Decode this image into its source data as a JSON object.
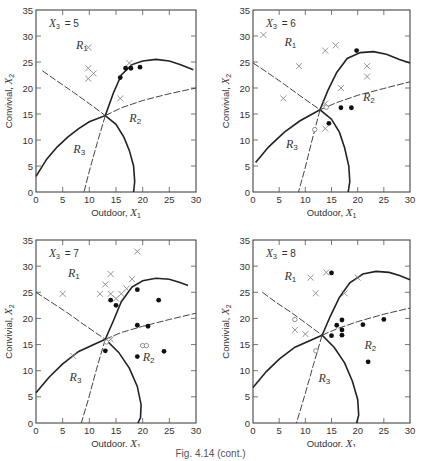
{
  "figure": {
    "caption": "Fig. 4.14 (cont.)"
  },
  "chart_data": [
    {
      "type": "scatter",
      "title": "X3 = 5",
      "panel_label": "X",
      "panel_sub": "3",
      "panel_value": "= 5",
      "xlabel": "Outdoor, X1",
      "ylabel": "Convivial, X2",
      "xlim": [
        0,
        30
      ],
      "ylim": [
        0,
        35
      ],
      "xticks": [
        0,
        5,
        10,
        15,
        20,
        25,
        30
      ],
      "yticks": [
        0,
        5,
        10,
        15,
        20,
        25,
        30,
        35
      ],
      "show_xlabel": true,
      "region_labels": [
        {
          "name": "R1",
          "x": 7.5,
          "y": 27.5
        },
        {
          "name": "R2",
          "x": 17.5,
          "y": 13.5
        },
        {
          "name": "R3",
          "x": 7,
          "y": 7.5
        }
      ],
      "series": [
        {
          "name": "Group 1 (x)",
          "marker": "cross",
          "points": [
            [
              9.8,
              27.8
            ],
            [
              9.8,
              23.8
            ],
            [
              9.8,
              21.8
            ],
            [
              10.8,
              22.8
            ],
            [
              17.5,
              24.8
            ],
            [
              15.8,
              18
            ]
          ]
        },
        {
          "name": "Group 2 (filled circle)",
          "marker": "dot",
          "points": [
            [
              15.8,
              22
            ],
            [
              16.8,
              23.8
            ],
            [
              17.8,
              23.8
            ],
            [
              19.5,
              24
            ]
          ]
        },
        {
          "name": "Group 3 (open circle)",
          "marker": "circle",
          "points": []
        }
      ],
      "boundaries": {
        "solid_upper": [
          [
            13,
            14.7
          ],
          [
            14.5,
            19
          ],
          [
            16,
            22.5
          ],
          [
            18,
            24.5
          ],
          [
            20,
            25.2
          ],
          [
            22.5,
            25.5
          ],
          [
            25,
            25.2
          ],
          [
            27,
            24.5
          ],
          [
            29.5,
            23.5
          ]
        ],
        "solid_lower": [
          [
            0,
            3
          ],
          [
            2,
            6.3
          ],
          [
            4,
            8.7
          ],
          [
            6,
            10.6
          ],
          [
            8,
            12.2
          ],
          [
            10,
            13.5
          ],
          [
            13,
            14.7
          ],
          [
            15,
            13
          ],
          [
            16.5,
            10.5
          ],
          [
            17.5,
            8
          ],
          [
            18.3,
            5
          ],
          [
            18.5,
            2
          ],
          [
            18.3,
            0
          ]
        ],
        "dashed_r1": [
          [
            1.2,
            23.3
          ],
          [
            4,
            21.3
          ],
          [
            7,
            19.2
          ],
          [
            10,
            17
          ],
          [
            13,
            14.7
          ]
        ],
        "dashed_r2": [
          [
            13,
            14.7
          ],
          [
            16,
            16.2
          ],
          [
            20,
            17.6
          ],
          [
            25,
            18.9
          ],
          [
            30,
            20
          ]
        ],
        "dashed_r3": [
          [
            13,
            14.7
          ],
          [
            11.5,
            9.5
          ],
          [
            10,
            4
          ],
          [
            9,
            0
          ]
        ]
      }
    },
    {
      "type": "scatter",
      "title": "X3 = 6",
      "panel_label": "X",
      "panel_sub": "3",
      "panel_value": "= 6",
      "xlabel": "Outdoor, X1",
      "ylabel": "Convivial, X2",
      "xlim": [
        0,
        30
      ],
      "ylim": [
        0,
        35
      ],
      "xticks": [
        0,
        5,
        10,
        15,
        20,
        25,
        30
      ],
      "yticks": [
        0,
        5,
        10,
        15,
        20,
        25,
        30,
        35
      ],
      "show_xlabel": true,
      "region_labels": [
        {
          "name": "R1",
          "x": 6,
          "y": 28
        },
        {
          "name": "R2",
          "x": 21,
          "y": 17.5
        },
        {
          "name": "R3",
          "x": 6.3,
          "y": 8.5
        }
      ],
      "series": [
        {
          "name": "Group 1 (x)",
          "marker": "cross",
          "points": [
            [
              2,
              30.2
            ],
            [
              8.8,
              24.2
            ],
            [
              5.8,
              18
            ],
            [
              13.8,
              27.2
            ],
            [
              15.8,
              28.2
            ],
            [
              16.8,
              20
            ],
            [
              21.8,
              24.2
            ],
            [
              21.8,
              22.2
            ],
            [
              13.8,
              17
            ],
            [
              13.8,
              12.2
            ]
          ]
        },
        {
          "name": "Group 2 (filled circle)",
          "marker": "dot",
          "points": [
            [
              19.8,
              27.2
            ],
            [
              16.8,
              16.2
            ],
            [
              18.8,
              16.2
            ],
            [
              14.5,
              13.2
            ]
          ]
        },
        {
          "name": "Group 3 (open circle)",
          "marker": "circle",
          "points": [
            [
              11.8,
              12
            ],
            [
              14,
              16.3
            ]
          ]
        }
      ],
      "boundaries": {
        "solid_upper": [
          [
            12.8,
            15.8
          ],
          [
            14.3,
            19.5
          ],
          [
            16,
            23
          ],
          [
            18,
            25.7
          ],
          [
            20.5,
            26.8
          ],
          [
            23,
            27
          ],
          [
            25.5,
            26.5
          ],
          [
            28,
            25.5
          ],
          [
            30,
            24.8
          ]
        ],
        "solid_lower": [
          [
            0.5,
            5.7
          ],
          [
            3,
            8.7
          ],
          [
            6,
            11.5
          ],
          [
            9,
            13.7
          ],
          [
            12.8,
            15.8
          ],
          [
            15,
            14
          ],
          [
            16.5,
            11.5
          ],
          [
            17.5,
            8.5
          ],
          [
            18.3,
            5
          ],
          [
            18.5,
            2
          ],
          [
            18.2,
            0
          ]
        ],
        "dashed_r1": [
          [
            0,
            24.8
          ],
          [
            3,
            22.8
          ],
          [
            6,
            20.7
          ],
          [
            9,
            18.5
          ],
          [
            12.8,
            15.8
          ]
        ],
        "dashed_r2": [
          [
            12.8,
            15.8
          ],
          [
            16,
            17.2
          ],
          [
            20,
            18.6
          ],
          [
            25,
            19.9
          ],
          [
            30,
            21.2
          ]
        ],
        "dashed_r3": [
          [
            12.8,
            15.8
          ],
          [
            11.3,
            10
          ],
          [
            9.8,
            4
          ],
          [
            8.7,
            0
          ]
        ]
      }
    },
    {
      "type": "scatter",
      "title": "X3 = 7",
      "panel_label": "X",
      "panel_sub": "3",
      "panel_value": "= 7",
      "xlabel": "Outdoor, X1",
      "ylabel": "Convivial, X2",
      "xlim": [
        0,
        30
      ],
      "ylim": [
        0,
        35
      ],
      "xticks": [
        0,
        5,
        10,
        15,
        20,
        25,
        30
      ],
      "yticks": [
        0,
        5,
        10,
        15,
        20,
        25,
        30,
        35
      ],
      "show_xlabel": true,
      "region_labels": [
        {
          "name": "R1",
          "x": 6,
          "y": 28
        },
        {
          "name": "R2",
          "x": 20,
          "y": 11.8
        },
        {
          "name": "R3",
          "x": 6.3,
          "y": 8
        }
      ],
      "series": [
        {
          "name": "Group 1 (x)",
          "marker": "cross",
          "points": [
            [
              5,
              24.7
            ],
            [
              7,
              12.8
            ],
            [
              12,
              24.7
            ],
            [
              13,
              26.5
            ],
            [
              14,
              28.5
            ],
            [
              14,
              24.7
            ],
            [
              15,
              23.8
            ],
            [
              16,
              24.7
            ],
            [
              17,
              25.7
            ],
            [
              18,
              27.5
            ],
            [
              19,
              32.8
            ],
            [
              14,
              16
            ]
          ]
        },
        {
          "name": "Group 2 (filled circle)",
          "marker": "dot",
          "points": [
            [
              14,
              23.5
            ],
            [
              15,
              22.5
            ],
            [
              19,
              25.5
            ],
            [
              23,
              23.5
            ],
            [
              19,
              18.7
            ],
            [
              21,
              18.5
            ],
            [
              13,
              13.8
            ],
            [
              19,
              12.7
            ],
            [
              24,
              13.7
            ]
          ]
        },
        {
          "name": "Group 3 (open circle)",
          "marker": "circle",
          "points": [
            [
              20,
              14.8
            ],
            [
              20.7,
              14.8
            ],
            [
              13.2,
              15.5
            ]
          ]
        }
      ],
      "boundaries": {
        "solid_upper": [
          [
            13,
            16
          ],
          [
            14.5,
            19.5
          ],
          [
            16,
            23.2
          ],
          [
            18,
            26
          ],
          [
            20,
            27.2
          ],
          [
            22.5,
            27.7
          ],
          [
            25,
            27.5
          ],
          [
            27,
            26.9
          ],
          [
            28.5,
            26.3
          ]
        ],
        "solid_lower": [
          [
            0,
            5.8
          ],
          [
            2.5,
            8.8
          ],
          [
            5,
            11.3
          ],
          [
            8,
            13.7
          ],
          [
            13,
            16
          ],
          [
            15.5,
            13.5
          ],
          [
            17.5,
            10.5
          ],
          [
            19,
            7
          ],
          [
            19.7,
            3.5
          ],
          [
            19.6,
            1
          ],
          [
            19.1,
            0
          ]
        ],
        "dashed_r1": [
          [
            0,
            25
          ],
          [
            3,
            23
          ],
          [
            6,
            21
          ],
          [
            9,
            18.8
          ],
          [
            13,
            16
          ]
        ],
        "dashed_r2": [
          [
            13,
            16
          ],
          [
            16,
            17.3
          ],
          [
            20,
            18.5
          ],
          [
            25,
            19.8
          ],
          [
            30,
            21
          ]
        ],
        "dashed_r3": [
          [
            13,
            16
          ],
          [
            11.4,
            10.5
          ],
          [
            9.8,
            4.5
          ],
          [
            8.5,
            0
          ]
        ]
      }
    },
    {
      "type": "scatter",
      "title": "X3 = 8",
      "panel_label": "X",
      "panel_sub": "3",
      "panel_value": "= 8",
      "xlabel": "Outdoor, X1",
      "ylabel": "Convivial, X2",
      "xlim": [
        0,
        30
      ],
      "ylim": [
        0,
        35
      ],
      "xticks": [
        0,
        5,
        10,
        15,
        20,
        25,
        30
      ],
      "yticks": [
        0,
        5,
        10,
        15,
        20,
        25,
        30,
        35
      ],
      "show_xlabel": true,
      "region_labels": [
        {
          "name": "R1",
          "x": 6,
          "y": 27.3
        },
        {
          "name": "R2",
          "x": 21.3,
          "y": 14.2
        },
        {
          "name": "R3",
          "x": 12.5,
          "y": 7.8
        }
      ],
      "series": [
        {
          "name": "Group 1 (x)",
          "marker": "cross",
          "points": [
            [
              11,
              27.8
            ],
            [
              14,
              28.8
            ],
            [
              12,
              24.8
            ],
            [
              17.5,
              24.8
            ],
            [
              20,
              27.8
            ],
            [
              8,
              17.8
            ],
            [
              10,
              17
            ]
          ]
        },
        {
          "name": "Group 2 (filled circle)",
          "marker": "dot",
          "points": [
            [
              15,
              28.7
            ],
            [
              15,
              16.7
            ],
            [
              16,
              18.7
            ],
            [
              17,
              19.7
            ],
            [
              17,
              17.8
            ],
            [
              17,
              16.8
            ],
            [
              21,
              18.8
            ],
            [
              25,
              19.8
            ],
            [
              22,
              11.7
            ]
          ]
        },
        {
          "name": "Group 3 (open circle)",
          "marker": "circle",
          "points": [
            [
              8,
              19.8
            ],
            [
              12,
              13.8
            ]
          ]
        }
      ],
      "boundaries": {
        "solid_upper": [
          [
            13.2,
            16.8
          ],
          [
            14.8,
            20.5
          ],
          [
            16.5,
            24
          ],
          [
            18.5,
            26.8
          ],
          [
            21,
            28.5
          ],
          [
            23.5,
            29
          ],
          [
            26,
            28.8
          ],
          [
            28,
            28.2
          ],
          [
            30,
            27.4
          ]
        ],
        "solid_lower": [
          [
            0,
            6.8
          ],
          [
            2.5,
            9.8
          ],
          [
            5,
            12.2
          ],
          [
            8,
            14.5
          ],
          [
            13.2,
            16.8
          ],
          [
            15.5,
            14.5
          ],
          [
            17.5,
            11.5
          ],
          [
            19,
            8
          ],
          [
            20,
            4.5
          ],
          [
            20.2,
            1.5
          ],
          [
            19.8,
            0
          ]
        ],
        "dashed_r1": [
          [
            1.8,
            25
          ],
          [
            4.5,
            23
          ],
          [
            7.5,
            21
          ],
          [
            10.5,
            18.8
          ],
          [
            13.2,
            16.8
          ]
        ],
        "dashed_r2": [
          [
            13.2,
            16.8
          ],
          [
            16,
            18
          ],
          [
            20,
            19.4
          ],
          [
            25,
            20.8
          ],
          [
            30,
            22
          ]
        ],
        "dashed_r3": [
          [
            13.2,
            16.8
          ],
          [
            11.5,
            11
          ],
          [
            9.8,
            5
          ],
          [
            8.3,
            0
          ]
        ]
      }
    }
  ],
  "panels_layout": [
    {
      "left": 36,
      "top": 10,
      "width": 160,
      "height": 182
    },
    {
      "left": 253,
      "top": 10,
      "width": 157,
      "height": 182
    },
    {
      "left": 36,
      "top": 240,
      "width": 160,
      "height": 183
    },
    {
      "left": 253,
      "top": 240,
      "width": 157,
      "height": 183
    }
  ]
}
